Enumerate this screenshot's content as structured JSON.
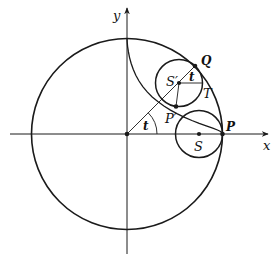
{
  "diagram": {
    "colors": {
      "stroke": "#1a1a1a",
      "background": "#ffffff"
    },
    "axes": {
      "x_label": "x",
      "y_label": "y"
    },
    "points": {
      "origin": "",
      "P": "P",
      "P_prime": "P′",
      "Q": "Q",
      "S": "S",
      "S_prime": "S′",
      "T": "T"
    },
    "angles": {
      "t_origin": "t",
      "t_rolling": "t"
    },
    "shapes": [
      "large circle centered at origin",
      "small circle centered at S tangent at P",
      "small circle centered at S′ tangent at Q",
      "astroid arc from top of large circle through P′ to P"
    ]
  }
}
